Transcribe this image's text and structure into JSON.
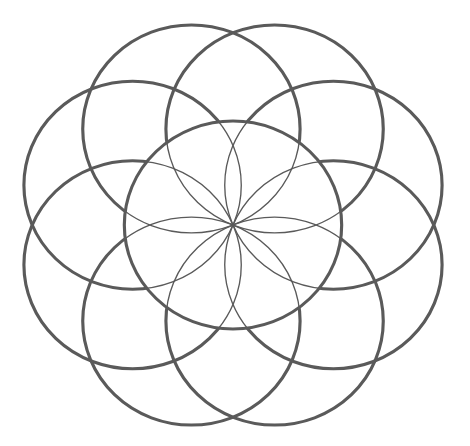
{
  "diagram": {
    "type": "rosette",
    "center": [
      233,
      225
    ],
    "scale": [
      1.045,
      1.0
    ],
    "radius": 104,
    "outer_circle_count": 8,
    "start_angle_deg": 22.5,
    "stroke_color": "#5a5a5a",
    "outer_stroke_width": 3,
    "inner_stroke_width": 1.3,
    "background": "#ffffff"
  }
}
